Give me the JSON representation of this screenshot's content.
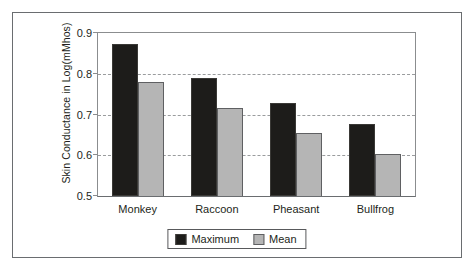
{
  "chart_data": {
    "type": "bar",
    "title": "",
    "xlabel": "",
    "ylabel": "Skin Conductance in Log(mMhos)",
    "categories": [
      "Monkey",
      "Raccoon",
      "Pheasant",
      "Bullfrog"
    ],
    "series": [
      {
        "name": "Maximum",
        "color": "#1d1c1a",
        "values": [
          0.873,
          0.789,
          0.729,
          0.676
        ]
      },
      {
        "name": "Mean",
        "color": "#b5b5b5",
        "values": [
          0.781,
          0.716,
          0.655,
          0.604
        ]
      }
    ],
    "ylim": [
      0.5,
      0.9
    ],
    "yticks": [
      0.5,
      0.6,
      0.7,
      0.8,
      0.9
    ],
    "ytick_labels": [
      "0.5",
      "0.6",
      "0.7",
      "0.8",
      "0.9"
    ],
    "grid": true,
    "grid_axis": "y",
    "grid_style": "dashed",
    "legend_position": "bottom-center",
    "frame": true
  },
  "colors": {
    "maximum": "#1d1c1a",
    "mean": "#b5b5b5",
    "axis": "#8b8d8f",
    "grid": "#9a9c9e",
    "frame": "#6a6d70",
    "text": "#231f20",
    "background": "#ffffff"
  }
}
